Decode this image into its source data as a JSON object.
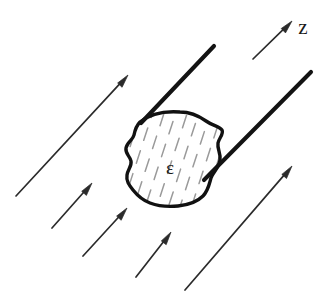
{
  "figure": {
    "background_color": "#ffffff",
    "width": 332,
    "height": 302,
    "style": "hand-drawn line sketch"
  },
  "labels": {
    "axis_label": "z",
    "region_label": "ε",
    "axis_label_position": {
      "x": 303,
      "y": 29
    },
    "region_label_position": {
      "x": 170,
      "y": 170
    }
  },
  "colors": {
    "ink": "#131313",
    "outline": "#111111",
    "hatch": "#9a9a9a",
    "arrow": "#2b2b2b",
    "background": "#ffffff"
  },
  "blob": {
    "name": "dielectric-region",
    "outline_path": "M 140 122 C 151 113 166 111 180 112 C 191 112 199 116 206 121 C 213 126 219 126 222 130 C 224 134 219 138 218 143 C 217 149 221 153 220 160 C 219 168 213 172 211 178 C 209 185 208 191 203 196 C 197 202 188 205 178 206 C 168 207 158 206 150 203 C 142 200 137 195 133 190 C 129 185 126 181 127 175 C 128 169 132 166 131 161 C 130 156 125 154 126 148 C 127 142 133 140 134 135 C 135 130 136 126 140 122 Z",
    "hatching": {
      "style": "dashed parallel strokes, tilted",
      "angle_deg": 72,
      "stroke_color": "#9a9a9a",
      "count": 34
    }
  },
  "thick_rays": [
    {
      "name": "upper-tangent-ray",
      "from": {
        "x": 214,
        "y": 46
      },
      "to": {
        "x": 141,
        "y": 123
      }
    },
    {
      "name": "lower-tangent-ray",
      "from": {
        "x": 311,
        "y": 72
      },
      "to": {
        "x": 204,
        "y": 180
      }
    }
  ],
  "field_arrows": [
    {
      "name": "field-arrow-z-axis",
      "from": {
        "x": 253,
        "y": 59
      },
      "to": {
        "x": 292,
        "y": 21
      },
      "label": "z"
    },
    {
      "name": "field-arrow-upper-left",
      "from": {
        "x": 16,
        "y": 196
      },
      "to": {
        "x": 128,
        "y": 75
      }
    },
    {
      "name": "field-arrow-mid-left",
      "from": {
        "x": 52,
        "y": 228
      },
      "to": {
        "x": 92,
        "y": 183
      }
    },
    {
      "name": "field-arrow-lower-left",
      "from": {
        "x": 83,
        "y": 256
      },
      "to": {
        "x": 127,
        "y": 208
      }
    },
    {
      "name": "field-arrow-bottom-center",
      "from": {
        "x": 136,
        "y": 277
      },
      "to": {
        "x": 171,
        "y": 232
      }
    },
    {
      "name": "field-arrow-lower-right",
      "from": {
        "x": 185,
        "y": 290
      },
      "to": {
        "x": 292,
        "y": 166
      }
    }
  ]
}
